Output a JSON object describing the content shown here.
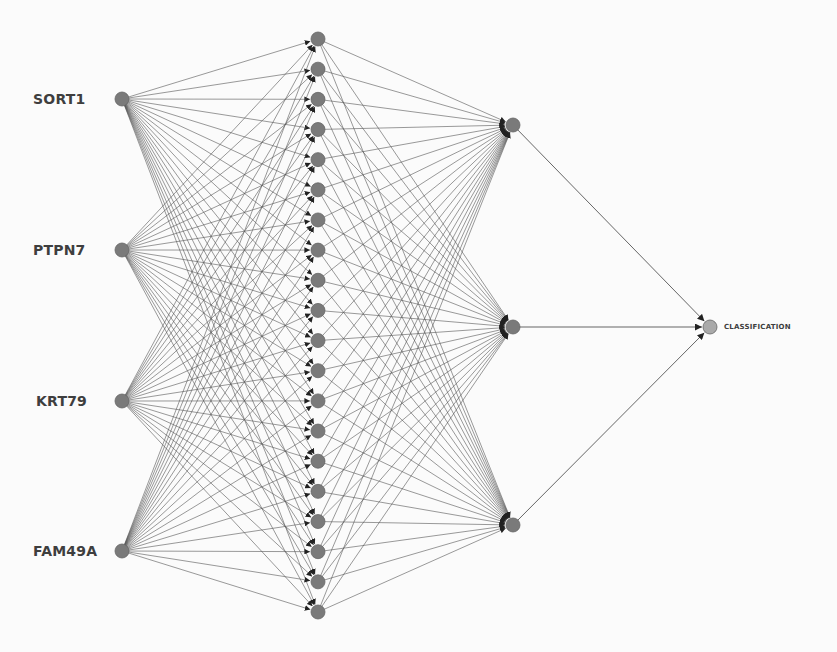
{
  "diagram": {
    "type": "neural-network",
    "colors": {
      "background": "#fbfbfb",
      "edge": "#555555",
      "node_fill": "#7a7a7a",
      "node_stroke": "#666666",
      "output_node_fill": "#a9a9a9",
      "label": "#3e3e3e"
    },
    "layers": [
      {
        "name": "input",
        "x": 122,
        "nodes": [
          {
            "label": "SORT1",
            "y": 99
          },
          {
            "label": "PTPN7",
            "y": 250
          },
          {
            "label": "KRT79",
            "y": 401
          },
          {
            "label": "FAM49A",
            "y": 551
          }
        ]
      },
      {
        "name": "hidden-1",
        "x": 318,
        "count": 20,
        "y_start": 39,
        "y_end": 612
      },
      {
        "name": "hidden-2",
        "x": 513,
        "nodes": [
          {
            "y": 125
          },
          {
            "y": 327
          },
          {
            "y": 525
          }
        ]
      },
      {
        "name": "output",
        "x": 710,
        "nodes": [
          {
            "label": "CLASSIFICATION",
            "y": 327
          }
        ]
      }
    ],
    "labels": {
      "input_0": "SORT1",
      "input_1": "PTPN7",
      "input_2": "KRT79",
      "input_3": "FAM49A",
      "output_0": "CLASSIFICATION"
    }
  }
}
